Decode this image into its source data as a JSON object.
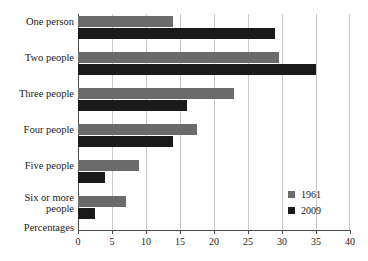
{
  "chart_data": {
    "type": "bar",
    "orientation": "horizontal",
    "title": "",
    "xlabel": "Percentages",
    "ylabel": "",
    "xlim": [
      0,
      40
    ],
    "xticks": [
      0,
      5,
      10,
      15,
      20,
      25,
      30,
      35,
      40
    ],
    "xtick_labels": [
      "0",
      "5",
      "10",
      "15",
      "20",
      "25",
      "30",
      "35",
      "40"
    ],
    "grid": true,
    "grid_axis": "x",
    "legend_position": "lower-right",
    "categories": [
      "One person",
      "Two people",
      "Three people",
      "Four people",
      "Five people",
      "Six or more people"
    ],
    "series": [
      {
        "name": "1961",
        "color": "#6b6b6b",
        "values": [
          14,
          29.5,
          23,
          17.5,
          9,
          7
        ]
      },
      {
        "name": "2009",
        "color": "#1a1a1a",
        "values": [
          29,
          35,
          16,
          14,
          4,
          2.5
        ]
      }
    ]
  },
  "axis": {
    "x_title": "Percentages"
  },
  "legend": {
    "entries": [
      {
        "label": "1961",
        "swatch": "legend-swatch-1961"
      },
      {
        "label": "2009",
        "swatch": "legend-swatch-2009"
      }
    ]
  },
  "category_labels": {
    "0_line1": "One person",
    "0_line2": "",
    "1_line1": "Two people",
    "1_line2": "",
    "2_line1": "Three people",
    "2_line2": "",
    "3_line1": "Four people",
    "3_line2": "",
    "4_line1": "Five people",
    "4_line2": "",
    "5_line1": "Six or more",
    "5_line2": "people"
  }
}
